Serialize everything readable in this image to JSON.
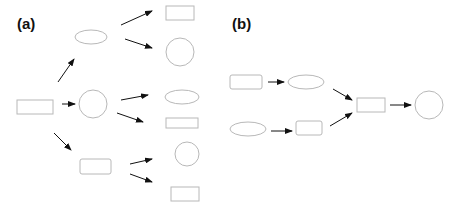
{
  "colors": {
    "node_stroke": "#b8b8b8",
    "edge": "#111111",
    "label": "#111111",
    "background": "#ffffff"
  },
  "panels": [
    {
      "label": "(a)",
      "description": "Tree: one root node branching out to three children, each of which branches to two leaf nodes",
      "nodes": [
        {
          "id": "a-root",
          "shape": "rectangle"
        },
        {
          "id": "a-upper",
          "shape": "ellipse"
        },
        {
          "id": "a-middle",
          "shape": "circle"
        },
        {
          "id": "a-lower",
          "shape": "rounded-rectangle"
        },
        {
          "id": "a-upper-leaf-1",
          "shape": "rectangle"
        },
        {
          "id": "a-upper-leaf-2",
          "shape": "circle"
        },
        {
          "id": "a-middle-leaf-1",
          "shape": "ellipse"
        },
        {
          "id": "a-middle-leaf-2",
          "shape": "rectangle"
        },
        {
          "id": "a-lower-leaf-1",
          "shape": "circle"
        },
        {
          "id": "a-lower-leaf-2",
          "shape": "rectangle"
        }
      ],
      "edges": [
        [
          "a-root",
          "a-upper"
        ],
        [
          "a-root",
          "a-middle"
        ],
        [
          "a-root",
          "a-lower"
        ],
        [
          "a-upper",
          "a-upper-leaf-1"
        ],
        [
          "a-upper",
          "a-upper-leaf-2"
        ],
        [
          "a-middle",
          "a-middle-leaf-1"
        ],
        [
          "a-middle",
          "a-middle-leaf-2"
        ],
        [
          "a-lower",
          "a-lower-leaf-1"
        ],
        [
          "a-lower",
          "a-lower-leaf-2"
        ]
      ]
    },
    {
      "label": "(b)",
      "description": "Merge: two parallel chains converge into a single node, which then leads to a final node",
      "nodes": [
        {
          "id": "b-top-start",
          "shape": "rounded-rectangle"
        },
        {
          "id": "b-top-next",
          "shape": "ellipse"
        },
        {
          "id": "b-bottom-start",
          "shape": "ellipse"
        },
        {
          "id": "b-bottom-next",
          "shape": "rounded-rectangle"
        },
        {
          "id": "b-merge",
          "shape": "rectangle"
        },
        {
          "id": "b-end",
          "shape": "circle"
        }
      ],
      "edges": [
        [
          "b-top-start",
          "b-top-next"
        ],
        [
          "b-bottom-start",
          "b-bottom-next"
        ],
        [
          "b-top-next",
          "b-merge"
        ],
        [
          "b-bottom-next",
          "b-merge"
        ],
        [
          "b-merge",
          "b-end"
        ]
      ]
    }
  ]
}
